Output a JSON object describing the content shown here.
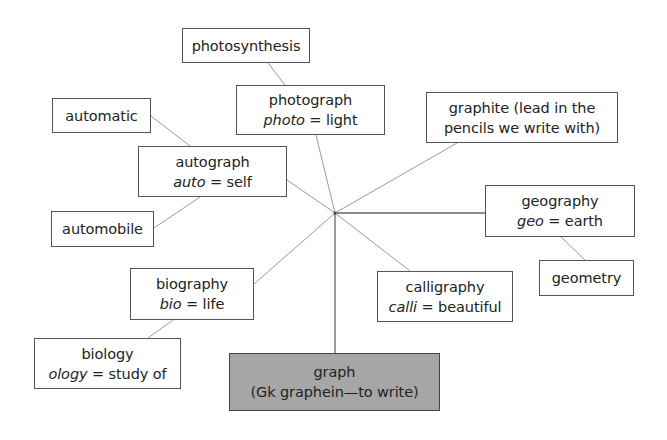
{
  "diagram": {
    "type": "word-web",
    "hub": {
      "x": 335,
      "y": 213
    },
    "colors": {
      "line": "#9a9a9a",
      "border": "#555555",
      "root_fill": "#a6a6a6",
      "background": "#ffffff"
    },
    "root": {
      "id": "graph",
      "line1": "graph",
      "line2": "(Gk graphein—to write)",
      "box": {
        "x": 229,
        "y": 353,
        "w": 211,
        "h": 58
      }
    },
    "nodes": [
      {
        "id": "photosynthesis",
        "line1": "photosynthesis",
        "box": {
          "x": 182,
          "y": 28,
          "w": 128,
          "h": 35
        }
      },
      {
        "id": "photograph",
        "line1": "photograph",
        "root": "photo",
        "meaning": "light",
        "box": {
          "x": 236,
          "y": 85,
          "w": 149,
          "h": 50
        }
      },
      {
        "id": "automatic",
        "line1": "automatic",
        "box": {
          "x": 52,
          "y": 98,
          "w": 99,
          "h": 35
        }
      },
      {
        "id": "autograph",
        "line1": "autograph",
        "root": "auto",
        "meaning": "self",
        "box": {
          "x": 138,
          "y": 146,
          "w": 149,
          "h": 51
        }
      },
      {
        "id": "automobile",
        "line1": "automobile",
        "box": {
          "x": 51,
          "y": 211,
          "w": 103,
          "h": 36
        }
      },
      {
        "id": "graphite",
        "line1": "graphite (lead in the",
        "line2": "pencils we write with)",
        "box": {
          "x": 426,
          "y": 92,
          "w": 192,
          "h": 51
        }
      },
      {
        "id": "geography",
        "line1": "geography",
        "root": "geo",
        "meaning": "earth",
        "box": {
          "x": 485,
          "y": 185,
          "w": 150,
          "h": 52
        }
      },
      {
        "id": "geometry",
        "line1": "geometry",
        "box": {
          "x": 539,
          "y": 260,
          "w": 95,
          "h": 36
        }
      },
      {
        "id": "biography",
        "line1": "biography",
        "root": "bio",
        "meaning": "life",
        "box": {
          "x": 130,
          "y": 268,
          "w": 124,
          "h": 52
        }
      },
      {
        "id": "biology",
        "line1": "biology",
        "root": "ology",
        "meaning": "study of",
        "box": {
          "x": 34,
          "y": 338,
          "w": 147,
          "h": 51
        }
      },
      {
        "id": "calligraphy",
        "line1": "calligraphy",
        "root": "calli",
        "meaning": "beautiful",
        "box": {
          "x": 377,
          "y": 271,
          "w": 136,
          "h": 51
        }
      }
    ],
    "links": [
      {
        "from": "hub",
        "to": "photograph",
        "x1": 335,
        "y1": 213,
        "x2": 316,
        "y2": 135
      },
      {
        "from": "hub",
        "to": "autograph",
        "x1": 335,
        "y1": 213,
        "x2": 287,
        "y2": 180
      },
      {
        "from": "hub",
        "to": "graphite",
        "x1": 335,
        "y1": 213,
        "x2": 457,
        "y2": 143
      },
      {
        "from": "hub",
        "to": "geography",
        "x1": 335,
        "y1": 213,
        "x2": 485,
        "y2": 213
      },
      {
        "from": "hub",
        "to": "biography",
        "x1": 335,
        "y1": 213,
        "x2": 254,
        "y2": 284
      },
      {
        "from": "hub",
        "to": "calligraphy",
        "x1": 335,
        "y1": 213,
        "x2": 410,
        "y2": 271
      },
      {
        "from": "hub",
        "to": "graph",
        "x1": 335,
        "y1": 213,
        "x2": 335,
        "y2": 353
      },
      {
        "from": "photograph",
        "to": "photosynthesis",
        "x1": 285,
        "y1": 85,
        "x2": 268,
        "y2": 63
      },
      {
        "from": "autograph",
        "to": "automatic",
        "x1": 190,
        "y1": 146,
        "x2": 151,
        "y2": 116
      },
      {
        "from": "autograph",
        "to": "automobile",
        "x1": 200,
        "y1": 197,
        "x2": 154,
        "y2": 228
      },
      {
        "from": "geography",
        "to": "geometry",
        "x1": 561,
        "y1": 237,
        "x2": 585,
        "y2": 260
      },
      {
        "from": "biography",
        "to": "biology",
        "x1": 173,
        "y1": 320,
        "x2": 148,
        "y2": 338
      }
    ]
  },
  "labels": {
    "equals": " = "
  }
}
